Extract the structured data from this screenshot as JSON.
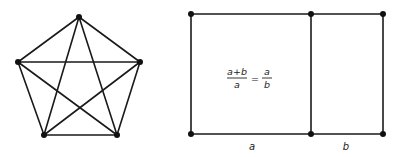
{
  "figures": [
    {
      "id": "complete-graph-k5",
      "description": "Complete graph on 5 vertices (pentagon with pentagram)",
      "vertices": [
        "top",
        "right",
        "bottom-right",
        "bottom-left",
        "left"
      ],
      "edges": [
        [
          "top",
          "right"
        ],
        [
          "right",
          "bottom-right"
        ],
        [
          "bottom-right",
          "bottom-left"
        ],
        [
          "bottom-left",
          "left"
        ],
        [
          "left",
          "top"
        ],
        [
          "top",
          "bottom-right"
        ],
        [
          "top",
          "bottom-left"
        ],
        [
          "right",
          "bottom-left"
        ],
        [
          "right",
          "left"
        ],
        [
          "left",
          "bottom-right"
        ]
      ]
    },
    {
      "id": "golden-rectangle",
      "description": "Rectangle split into two parts of widths a and b",
      "formula": {
        "lhs_numerator": "a+b",
        "lhs_denominator": "a",
        "equals": "=",
        "rhs_numerator": "a",
        "rhs_denominator": "b"
      },
      "labels": {
        "left_segment": "a",
        "right_segment": "b"
      }
    }
  ]
}
